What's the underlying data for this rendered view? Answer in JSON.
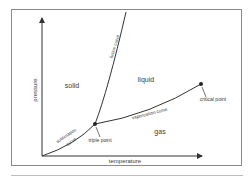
{
  "diagram": {
    "type": "phase-diagram",
    "axes": {
      "x_label": "temperature",
      "y_label": "pressure"
    },
    "regions": {
      "solid": "solid",
      "liquid": "liquid",
      "gas": "gas"
    },
    "curves": {
      "fusion": "fusion curve",
      "vaporization": "vaporization curve",
      "sublimation_line1": "sublimation",
      "sublimation_line2": "curve"
    },
    "points": {
      "triple": "triple point",
      "critical": "critical point"
    },
    "colors": {
      "line": "#333333",
      "frame": "#8a8a8a",
      "text": "#3a3a3a"
    }
  }
}
